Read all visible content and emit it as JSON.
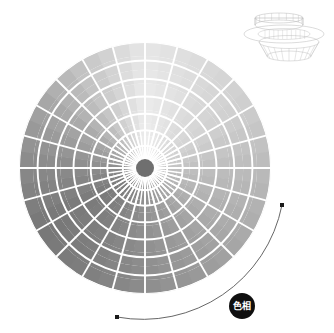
{
  "page": {
    "background_color": "#ffffff",
    "width": 334,
    "height": 333
  },
  "wheel": {
    "name": "hue-color-wheel",
    "center_x": 145,
    "center_y": 168,
    "radius": 126,
    "hub_radius": 9,
    "hub_color": "#6f6f6f",
    "grid_color": "#ffffff",
    "sector_count": 48,
    "ring_count": 9,
    "major_sector_count": 24,
    "major_ring_count": 7,
    "desaturated": true,
    "note": "grayscale (saturation = 0) polar hue wheel",
    "hue_gray_stops": [
      {
        "angle_deg": 0,
        "gray": "#e9e9e9"
      },
      {
        "angle_deg": 30,
        "gray": "#dcdcdc"
      },
      {
        "angle_deg": 60,
        "gray": "#cfcfcf"
      },
      {
        "angle_deg": 90,
        "gray": "#bdbdbd"
      },
      {
        "angle_deg": 120,
        "gray": "#aeaeae"
      },
      {
        "angle_deg": 150,
        "gray": "#9d9d9d"
      },
      {
        "angle_deg": 180,
        "gray": "#8e8e8e"
      },
      {
        "angle_deg": 210,
        "gray": "#7f7f7f"
      },
      {
        "angle_deg": 240,
        "gray": "#787878"
      },
      {
        "angle_deg": 270,
        "gray": "#8a8a8a"
      },
      {
        "angle_deg": 300,
        "gray": "#a5a5a5"
      },
      {
        "angle_deg": 330,
        "gray": "#c8c8c8"
      },
      {
        "angle_deg": 360,
        "gray": "#e9e9e9"
      }
    ]
  },
  "inset": {
    "name": "wireframe-3d-inset",
    "x": 243,
    "y": 6,
    "width": 82,
    "height": 56,
    "stroke_color": "#b8b8b8",
    "description": "faint wireframe 3d color-solid preview"
  },
  "arc": {
    "name": "hue-rotation-arc",
    "stroke_color": "#555555",
    "start_point": {
      "x": 117,
      "y": 317
    },
    "end_point": {
      "x": 282,
      "y": 205
    },
    "marker_color": "#1a1a1a",
    "direction": "counter-clockwise"
  },
  "badge": {
    "name": "hue-badge",
    "label": "色相",
    "center_x": 242,
    "center_y": 306,
    "radius": 13,
    "fill_color": "#0f0f0f",
    "text_color": "#ffffff"
  }
}
